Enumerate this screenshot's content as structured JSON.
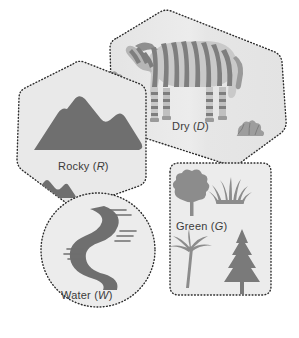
{
  "diagram": {
    "type": "venn-overlapping-regions",
    "colors": {
      "page_background": "#ffffff",
      "region_fill": "#e8e8e8",
      "region_fill_light": "#efefef",
      "region_outline": "#2b2b2b",
      "icon_dark": "#6e6e6e",
      "icon_mid": "#8c8c8c",
      "icon_light": "#a8a8a8",
      "label_text": "#3b3b3b"
    },
    "outline_style": "dotted",
    "regions": [
      {
        "id": "dry",
        "name": "Dry",
        "symbol": "D",
        "label": "Dry (D)",
        "shape": "rounded-polygon",
        "icons": [
          "zebra-icon",
          "bush-icon",
          "bush-icon"
        ]
      },
      {
        "id": "rocky",
        "name": "Rocky",
        "symbol": "R",
        "label": "Rocky (R)",
        "shape": "rounded-hexagon",
        "icons": [
          "mountain-large-icon",
          "mountain-small-icon"
        ]
      },
      {
        "id": "water",
        "name": "Water",
        "symbol": "W",
        "label": "Water (W)",
        "shape": "circle",
        "icons": [
          "river-icon"
        ]
      },
      {
        "id": "green",
        "name": "Green",
        "symbol": "G",
        "label": "Green (G)",
        "shape": "rounded-square",
        "icons": [
          "deciduous-tree-icon",
          "grass-icon",
          "palm-tree-icon",
          "pine-tree-icon"
        ]
      }
    ]
  }
}
